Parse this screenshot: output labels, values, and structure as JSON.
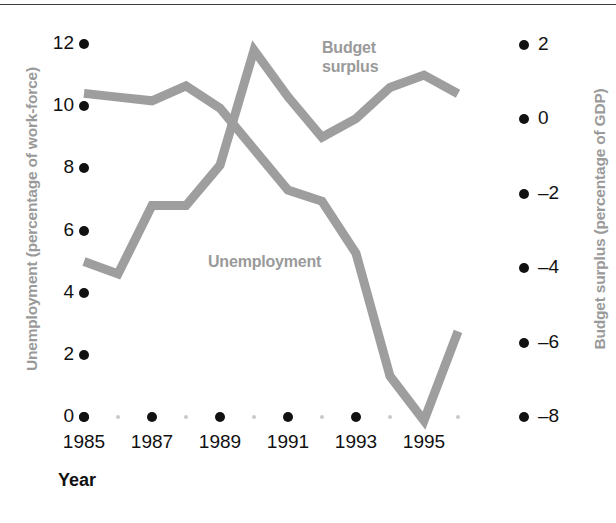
{
  "figure": {
    "background": "#ffffff",
    "series_color": "#9e9e9e",
    "tick_color": "#111111",
    "label_color": "#9a9a9a"
  },
  "axes": {
    "x": {
      "title": "Year",
      "tick_labels": [
        "1985",
        "1987",
        "1989",
        "1991",
        "1993",
        "1995"
      ],
      "minor_years": [
        "1986",
        "1988",
        "1990",
        "1992",
        "1994",
        "1996"
      ],
      "range": [
        1985,
        1996
      ]
    },
    "y_left": {
      "title": "Unemployment (percentage of work-force)",
      "tick_labels": [
        "12",
        "10",
        "8",
        "6",
        "4",
        "2",
        "0"
      ],
      "range": [
        0,
        12
      ]
    },
    "y_right": {
      "title": "Budget surplus (percentage of GDP)",
      "tick_labels": [
        "2",
        "0",
        "–2",
        "–4",
        "–6",
        "–8"
      ],
      "range": [
        -8,
        2
      ]
    }
  },
  "series_labels": {
    "budget": "Budget\nsurplus",
    "unemployment": "Unemployment"
  },
  "chart_data": {
    "type": "line",
    "title": "",
    "xlabel": "Year",
    "ylabel": "Unemployment (percentage of work-force)",
    "ylabel_secondary": "Budget surplus (percentage of GDP)",
    "x": [
      1985,
      1986,
      1987,
      1988,
      1989,
      1990,
      1991,
      1992,
      1993,
      1994,
      1995,
      1996
    ],
    "xlim": [
      1985,
      1996
    ],
    "ylim": [
      0,
      12
    ],
    "ylim_secondary": [
      -8,
      2
    ],
    "grid": false,
    "legend": "inline-annotations",
    "series": [
      {
        "name": "Unemployment",
        "axis": "left",
        "units": "percentage of work-force",
        "color": "#9e9e9e",
        "values": [
          5.0,
          4.6,
          6.8,
          6.8,
          8.1,
          11.8,
          10.3,
          9.0,
          9.6,
          10.6,
          11.0,
          10.4
        ]
      },
      {
        "name": "Budget surplus",
        "axis": "right",
        "units": "percentage of GDP",
        "color": "#9e9e9e",
        "values": [
          0.7,
          0.6,
          0.5,
          0.9,
          0.3,
          -0.8,
          -1.9,
          -2.2,
          -3.6,
          -6.9,
          -8.1,
          -5.7
        ]
      }
    ]
  }
}
